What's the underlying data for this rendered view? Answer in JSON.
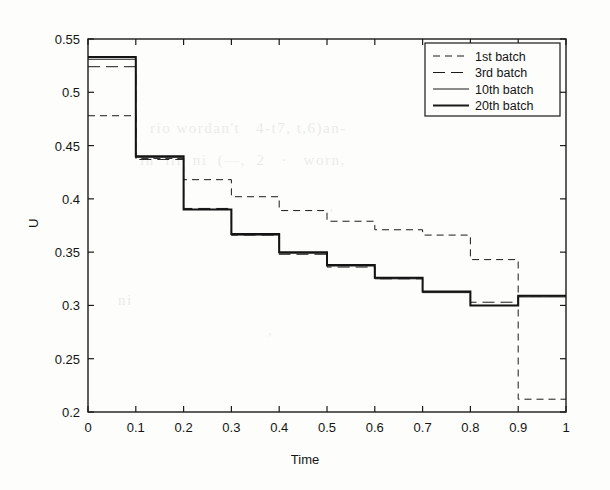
{
  "figure": {
    "title": "",
    "y_axis_label": "U",
    "x_axis_label": "Time"
  },
  "legend": {
    "position": "top-right",
    "entries": [
      {
        "label": "1st batch",
        "style": "dashed-short",
        "width": 1
      },
      {
        "label": "3rd batch",
        "style": "dashed-long",
        "width": 1
      },
      {
        "label": "10th batch",
        "style": "solid",
        "width": 1
      },
      {
        "label": "20th batch",
        "style": "solid",
        "width": 2
      }
    ]
  },
  "chart_data": {
    "type": "line",
    "title": "",
    "xlabel": "Time",
    "ylabel": "U",
    "xlim": [
      0,
      1
    ],
    "ylim": [
      0.2,
      0.55
    ],
    "xticks": [
      "0",
      "0.1",
      "0.2",
      "0.3",
      "0.4",
      "0.5",
      "0.6",
      "0.7",
      "0.8",
      "0.9",
      "1"
    ],
    "yticks": [
      "0.55",
      "0.5",
      "0.45",
      "0.4",
      "0.35",
      "0.3",
      "0.25",
      "0.2"
    ],
    "xtick_values": [
      0,
      0.1,
      0.2,
      0.3,
      0.4,
      0.5,
      0.6,
      0.7,
      0.8,
      0.9,
      1
    ],
    "ytick_values": [
      0.55,
      0.5,
      0.45,
      0.4,
      0.35,
      0.3,
      0.25,
      0.2
    ],
    "grid": false,
    "legend_position": "top-right",
    "step_edges": [
      0,
      0.1,
      0.2,
      0.3,
      0.4,
      0.5,
      0.6,
      0.7,
      0.8,
      0.9,
      1.0
    ],
    "series": [
      {
        "name": "1st batch",
        "style": "dashed-short",
        "width": 1,
        "color": "#1a1a1a",
        "values": [
          0.478,
          0.438,
          0.418,
          0.402,
          0.389,
          0.379,
          0.371,
          0.366,
          0.343,
          0.212
        ]
      },
      {
        "name": "3rd batch",
        "style": "dashed-long",
        "width": 1,
        "color": "#1a1a1a",
        "values": [
          0.524,
          0.437,
          0.391,
          0.366,
          0.348,
          0.336,
          0.325,
          0.313,
          0.303,
          0.309
        ]
      },
      {
        "name": "10th batch",
        "style": "solid",
        "width": 1,
        "color": "#1a1a1a",
        "values": [
          0.531,
          0.439,
          0.39,
          0.366,
          0.349,
          0.337,
          0.325,
          0.312,
          0.3,
          0.308
        ]
      },
      {
        "name": "20th batch",
        "style": "solid",
        "width": 2,
        "color": "#141414",
        "values": [
          0.533,
          0.44,
          0.39,
          0.367,
          0.35,
          0.338,
          0.326,
          0.313,
          0.3,
          0.309
        ]
      }
    ]
  },
  "plot_box": {
    "left": 88,
    "right": 566,
    "top": 39,
    "bottom": 412
  },
  "background_text": [
    {
      "text": "rio wordan't  4-t7, 4-6)an-",
      "x": 150,
      "y": 128
    },
    {
      "text": "in  iil  ni  (—,  2   ·   worn,",
      "x": 140,
      "y": 160
    },
    {
      "text": "ni",
      "x": 150,
      "y": 300
    },
    {
      "text": ",",
      "x": 270,
      "y": 330
    }
  ]
}
